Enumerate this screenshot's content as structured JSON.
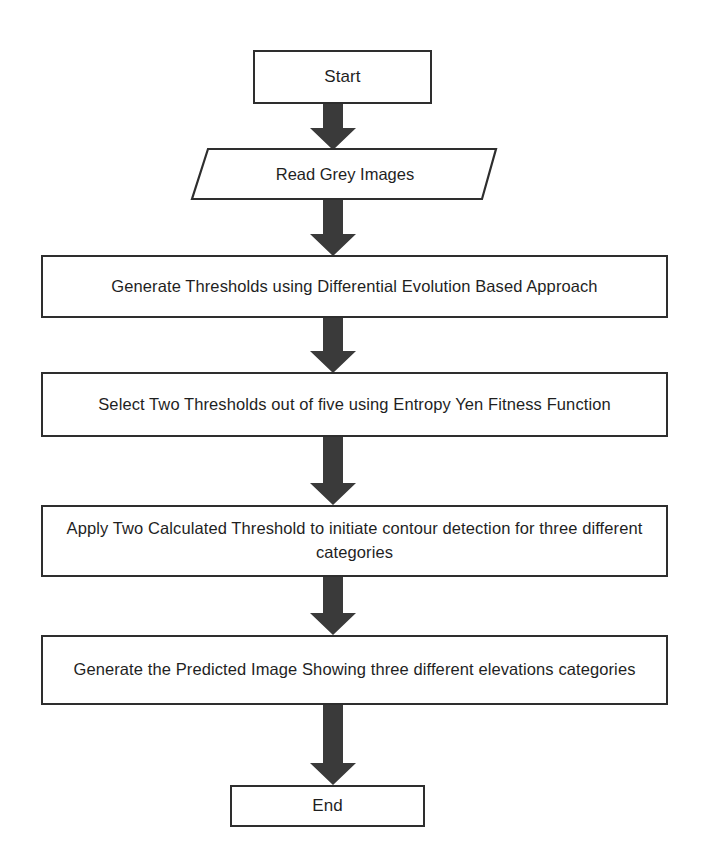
{
  "diagram": {
    "background_color": "#ffffff",
    "stroke_color": "#2e2e2e",
    "text_color": "#1f1f1f",
    "arrow_color": "#3a3a3a"
  },
  "nodes": [
    {
      "id": "start",
      "shape": "rectangle",
      "role": "terminator",
      "label": "Start"
    },
    {
      "id": "read-grey-images",
      "shape": "parallelogram",
      "role": "input-output",
      "label": "Read Grey Images"
    },
    {
      "id": "generate-thresholds",
      "shape": "rectangle",
      "role": "process",
      "label": "Generate Thresholds using Differential Evolution Based Approach"
    },
    {
      "id": "select-two-thresholds",
      "shape": "rectangle",
      "role": "process",
      "label": "Select Two Thresholds out of five using Entropy Yen Fitness Function"
    },
    {
      "id": "apply-thresholds",
      "shape": "rectangle",
      "role": "process",
      "label": "Apply Two Calculated Threshold to initiate contour detection for three different categories"
    },
    {
      "id": "generate-predicted-image",
      "shape": "rectangle",
      "role": "process",
      "label": "Generate the Predicted Image Showing three different elevations categories"
    },
    {
      "id": "end",
      "shape": "rectangle",
      "role": "terminator",
      "label": "End"
    }
  ],
  "connectors": [
    {
      "id": "arrow-1",
      "from": "start",
      "to": "read-grey-images",
      "direction": "down"
    },
    {
      "id": "arrow-2",
      "from": "read-grey-images",
      "to": "generate-thresholds",
      "direction": "down"
    },
    {
      "id": "arrow-3",
      "from": "generate-thresholds",
      "to": "select-two-thresholds",
      "direction": "down"
    },
    {
      "id": "arrow-4",
      "from": "select-two-thresholds",
      "to": "apply-thresholds",
      "direction": "down"
    },
    {
      "id": "arrow-5",
      "from": "apply-thresholds",
      "to": "generate-predicted-image",
      "direction": "down"
    },
    {
      "id": "arrow-6",
      "from": "generate-predicted-image",
      "to": "end",
      "direction": "down"
    }
  ]
}
